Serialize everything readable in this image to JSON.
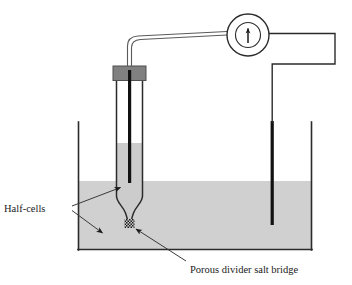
{
  "figure": {
    "type": "diagram",
    "width": 352,
    "height": 285
  },
  "labels": {
    "half_cells": "Half-cells",
    "porous_divider": "Porous divider salt bridge"
  },
  "meter": {
    "name": "current-meter",
    "symbol": "needle-pointer",
    "outer_radius": 21,
    "inner_radius": 13,
    "center_x": 248,
    "center_y": 35
  },
  "colors": {
    "liquid": "#d0d0d0",
    "inner_liquid": "#cccccc",
    "cap": "#808080",
    "electrode": "#111111",
    "outline": "#2b2b2b",
    "wire": "#4a4a4a",
    "background": "#ffffff",
    "text": "#1a1a1a"
  },
  "parts": {
    "beaker": "outer-beaker",
    "inner_tube": "inner-half-cell-tube",
    "stopper": "grey-stopper-cap",
    "left_electrode": "left-electrode",
    "right_electrode": "right-electrode",
    "porous_divider": "porous-divider-hatch",
    "left_wire": "wire-to-meter-left",
    "right_wire": "wire-to-meter-right"
  },
  "annotations": [
    {
      "id": "half-cells-arrow-upper",
      "label_ref": "half_cells",
      "from": [
        72,
        206
      ],
      "to": [
        124,
        186
      ]
    },
    {
      "id": "half-cells-arrow-lower",
      "label_ref": "half_cells",
      "from": [
        72,
        210
      ],
      "to": [
        106,
        236
      ]
    },
    {
      "id": "porous-divider-leader",
      "label_ref": "porous_divider",
      "from": [
        185,
        262
      ],
      "to": [
        134,
        228
      ]
    }
  ]
}
